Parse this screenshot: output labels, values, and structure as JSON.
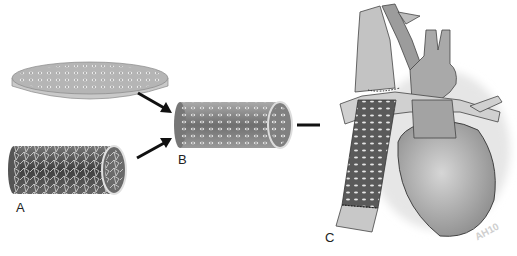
{
  "figure": {
    "panels": [
      {
        "id": "A",
        "label": "A",
        "description": "Seeded cell culture dish and porous tubular scaffold"
      },
      {
        "id": "B",
        "label": "B",
        "description": "Cell-seeded tubular scaffold (tissue-engineered graft)"
      },
      {
        "id": "C",
        "label": "C",
        "description": "Graft implanted connecting vessel to heart"
      }
    ],
    "watermark": "AH10",
    "colors": {
      "background": "#ffffff",
      "arrow": "#111111",
      "scaffold_dark": "#4a4a4a",
      "heart": "#a8a8a8",
      "vessel": "#bdbdbd"
    }
  }
}
